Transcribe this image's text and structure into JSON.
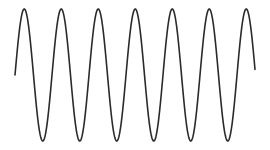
{
  "figure": {
    "type": "sine-wave",
    "background": "#ffffff",
    "stroke_color": "#2a2a2a",
    "stroke_width": 1.6,
    "wave": {
      "x_start": 15,
      "x_end": 255,
      "midline_y": 75,
      "amplitude": 66,
      "period": 37,
      "peak_count": 7,
      "trough_count": 6,
      "starts_at": "midline-rising",
      "ends_at": "midline-falling"
    }
  }
}
